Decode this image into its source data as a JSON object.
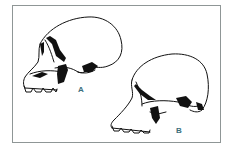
{
  "figure": {
    "skulls": [
      {
        "id": "A",
        "label": "A"
      },
      {
        "id": "B",
        "label": "B"
      }
    ]
  },
  "colors": {
    "frame_border": "#8f9696",
    "label": "#3c6f7c",
    "ink": "#111111"
  }
}
